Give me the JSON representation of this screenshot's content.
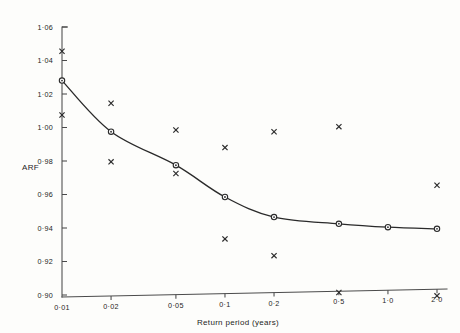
{
  "chart_data": {
    "type": "scatter",
    "title": "",
    "xlabel": "Return period (years)",
    "ylabel": "ARF",
    "xscale": "log",
    "xlim": [
      0.01,
      2.0
    ],
    "ylim": [
      0.9,
      1.06
    ],
    "grid": false,
    "legend": null,
    "x_ticks": [
      0.01,
      0.02,
      0.05,
      0.1,
      0.2,
      0.5,
      1.0,
      2.0
    ],
    "x_tick_labels": [
      "0·01",
      "0·02",
      "0·05",
      "0·1",
      "0·2",
      "0·5",
      "1·0",
      "2·0"
    ],
    "y_ticks": [
      0.9,
      0.92,
      0.94,
      0.96,
      0.98,
      1.0,
      1.02,
      1.04,
      1.06
    ],
    "y_tick_labels": [
      "0·90",
      "0·92",
      "0·94",
      "0·96",
      "0·98",
      "1·00",
      "1·02",
      "1·04",
      "1·06"
    ],
    "series": [
      {
        "name": "fitted-values",
        "marker": "circle",
        "has_curve": true,
        "x": [
          0.01,
          0.02,
          0.05,
          0.1,
          0.2,
          0.5,
          1.0,
          2.0
        ],
        "values": [
          1.028,
          0.9975,
          0.9775,
          0.9585,
          0.9465,
          0.9425,
          0.9405,
          0.9395
        ]
      },
      {
        "name": "upper-scatter",
        "marker": "cross",
        "has_curve": false,
        "x": [
          0.01,
          0.02,
          0.05,
          0.1,
          0.2,
          0.5,
          2.0
        ],
        "values": [
          1.0455,
          1.0145,
          0.9985,
          0.988,
          0.9975,
          1.0005,
          0.9655
        ]
      },
      {
        "name": "lower-scatter",
        "marker": "cross",
        "has_curve": false,
        "x": [
          0.01,
          0.02,
          0.05,
          0.1,
          0.2,
          0.5,
          2.0
        ],
        "values": [
          1.0075,
          0.9795,
          0.9725,
          0.9335,
          0.9235,
          0.9015,
          0.8995
        ]
      }
    ]
  },
  "figure": {
    "axis_color": "#4a4a4a",
    "curve_color": "#2a2a2a",
    "marker_color": "#2b2b2b",
    "background": "#fdfdfb"
  }
}
